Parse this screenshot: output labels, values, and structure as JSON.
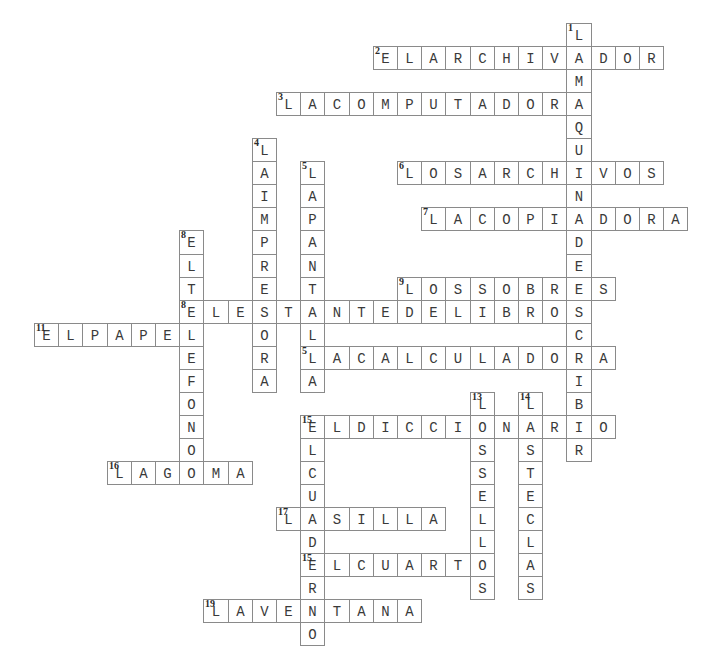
{
  "puzzle": {
    "type": "crossword",
    "grid": {
      "origin_x": 34,
      "origin_y": 23,
      "cell_w": 24.2,
      "cell_h": 23.05
    },
    "colors": {
      "border": "#8a8a8a",
      "letter": "#3a3a3a",
      "number": "#2a2a2a",
      "background": "#ffffff"
    },
    "words": [
      {
        "number": "1",
        "direction": "down",
        "row": 0,
        "col": 22,
        "answer": "LAMAQUINADEESCRIBIR"
      },
      {
        "number": "2",
        "direction": "across",
        "row": 1,
        "col": 14,
        "answer": "ELARCHIVADOR"
      },
      {
        "number": "3",
        "direction": "across",
        "row": 3,
        "col": 10,
        "answer": "LACOMPUTADORA"
      },
      {
        "number": "4",
        "direction": "down",
        "row": 5,
        "col": 9,
        "answer": "LAIMPRESORA"
      },
      {
        "number": "5",
        "direction": "down",
        "row": 6,
        "col": 11,
        "answer": "LAPANTALLA"
      },
      {
        "number": "6",
        "direction": "across",
        "row": 6,
        "col": 15,
        "answer": "LOSARCHIVOS"
      },
      {
        "number": "7",
        "direction": "across",
        "row": 8,
        "col": 16,
        "answer": "LACOPIADORA"
      },
      {
        "number": "8",
        "direction": "down",
        "row": 9,
        "col": 6,
        "answer": "ELTELEFONO"
      },
      {
        "number": "9",
        "direction": "across",
        "row": 11,
        "col": 15,
        "answer": "LOSSOBRES"
      },
      {
        "number": "10",
        "direction": "across",
        "row": 12,
        "col": 6,
        "answer": "ELESTANTEDELIBROS"
      },
      {
        "number": "11",
        "direction": "across",
        "row": 13,
        "col": 0,
        "answer": "ELPAPEL"
      },
      {
        "number": "12",
        "direction": "across",
        "row": 14,
        "col": 11,
        "answer": "LACALCULADORA"
      },
      {
        "number": "13",
        "direction": "down",
        "row": 16,
        "col": 18,
        "answer": "LOSSELLOS"
      },
      {
        "number": "14",
        "direction": "down",
        "row": 16,
        "col": 20,
        "answer": "LASTECLAS"
      },
      {
        "number": "15",
        "direction": "across",
        "row": 17,
        "col": 11,
        "answer": "ELDICCIONARIO"
      },
      {
        "number": "15",
        "direction": "down",
        "row": 17,
        "col": 11,
        "answer": "ELCUADERNO"
      },
      {
        "number": "16",
        "direction": "across",
        "row": 19,
        "col": 3,
        "answer": "LAGOMA"
      },
      {
        "number": "17",
        "direction": "across",
        "row": 21,
        "col": 10,
        "answer": "LASILLA"
      },
      {
        "number": "18",
        "direction": "across",
        "row": 23,
        "col": 11,
        "answer": "ELCUARTO"
      },
      {
        "number": "19",
        "direction": "across",
        "row": 25,
        "col": 7,
        "answer": "LAVENTANA"
      }
    ]
  }
}
